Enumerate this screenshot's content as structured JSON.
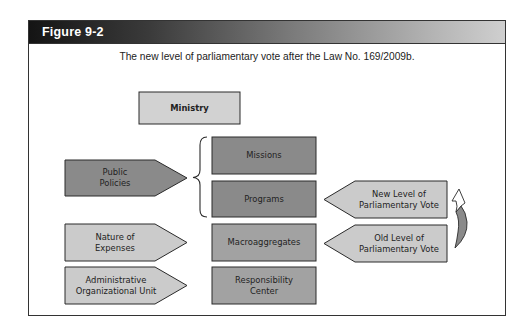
{
  "figure": {
    "label": "Figure 9-2",
    "caption": "The new level of parliamentary vote after the Law No. 169/2009b."
  },
  "colors": {
    "light_box": "#d2d2d2",
    "dark_box": "#8a8a8a",
    "mid_box": "#a2a2a2",
    "light_arrow": "#cbcbcb",
    "border": "#2a2a2a"
  },
  "diagram": {
    "top_box": {
      "label": "Ministry"
    },
    "left_arrows": [
      {
        "label": "Public\nPolicies"
      },
      {
        "label": "Nature of\nExpenses"
      },
      {
        "label": "Administrative\nOrganizational Unit"
      }
    ],
    "center_boxes": [
      {
        "label": "Missions"
      },
      {
        "label": "Programs"
      },
      {
        "label": "Macroaggregates"
      },
      {
        "label": "Responsibility\nCenter"
      }
    ],
    "right_arrows": [
      {
        "label": "New Level of\nParliamentary Vote"
      },
      {
        "label": "Old Level of\nParliamentary Vote"
      }
    ]
  }
}
